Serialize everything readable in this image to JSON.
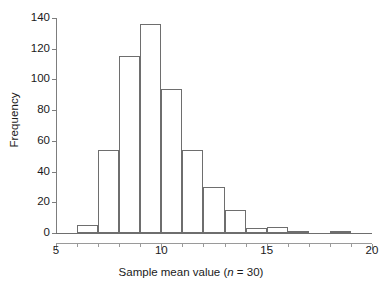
{
  "chart_data": {
    "type": "bar",
    "title": "",
    "subtitle": "",
    "xlabel_prefix": "Sample mean value (",
    "xlabel_italic": "n",
    "xlabel_suffix": " = 30)",
    "xlabel_full": "Sample mean value (n = 30)",
    "ylabel": "Frequency",
    "xlim": [
      5,
      20
    ],
    "ylim": [
      0,
      140
    ],
    "grid": false,
    "legend": null,
    "bin_width": 1,
    "x_major_ticks": [
      5,
      10,
      15,
      20
    ],
    "x_major_tick_labels": [
      "5",
      "10",
      "15",
      "20"
    ],
    "x_minor_ticks": [
      6,
      7,
      8,
      9,
      11,
      12,
      13,
      14,
      16,
      17,
      18,
      19
    ],
    "y_ticks": [
      0,
      20,
      40,
      60,
      80,
      100,
      120,
      140
    ],
    "y_tick_labels": [
      "0",
      "20",
      "40",
      "60",
      "80",
      "100",
      "120",
      "140"
    ],
    "bins": [
      {
        "start": 6,
        "end": 7,
        "value": 5
      },
      {
        "start": 7,
        "end": 8,
        "value": 54
      },
      {
        "start": 8,
        "end": 9,
        "value": 115
      },
      {
        "start": 9,
        "end": 10,
        "value": 136
      },
      {
        "start": 10,
        "end": 11,
        "value": 94
      },
      {
        "start": 11,
        "end": 12,
        "value": 54
      },
      {
        "start": 12,
        "end": 13,
        "value": 30
      },
      {
        "start": 13,
        "end": 14,
        "value": 15
      },
      {
        "start": 14,
        "end": 15,
        "value": 3
      },
      {
        "start": 15,
        "end": 16,
        "value": 4
      },
      {
        "start": 16,
        "end": 17,
        "value": 1
      },
      {
        "start": 17,
        "end": 18,
        "value": 0
      },
      {
        "start": 18,
        "end": 19,
        "value": 1
      }
    ],
    "categories": [
      "6-7",
      "7-8",
      "8-9",
      "9-10",
      "10-11",
      "11-12",
      "12-13",
      "13-14",
      "14-15",
      "15-16",
      "16-17",
      "17-18",
      "18-19"
    ],
    "values": [
      5,
      54,
      115,
      136,
      94,
      54,
      30,
      15,
      3,
      4,
      1,
      0,
      1
    ],
    "colors": {
      "bar_fill": "#ffffff",
      "bar_stroke": "#6e6e6e",
      "axis": "#7d7d7d",
      "text": "#1a1a1a",
      "background": "#ffffff"
    }
  }
}
